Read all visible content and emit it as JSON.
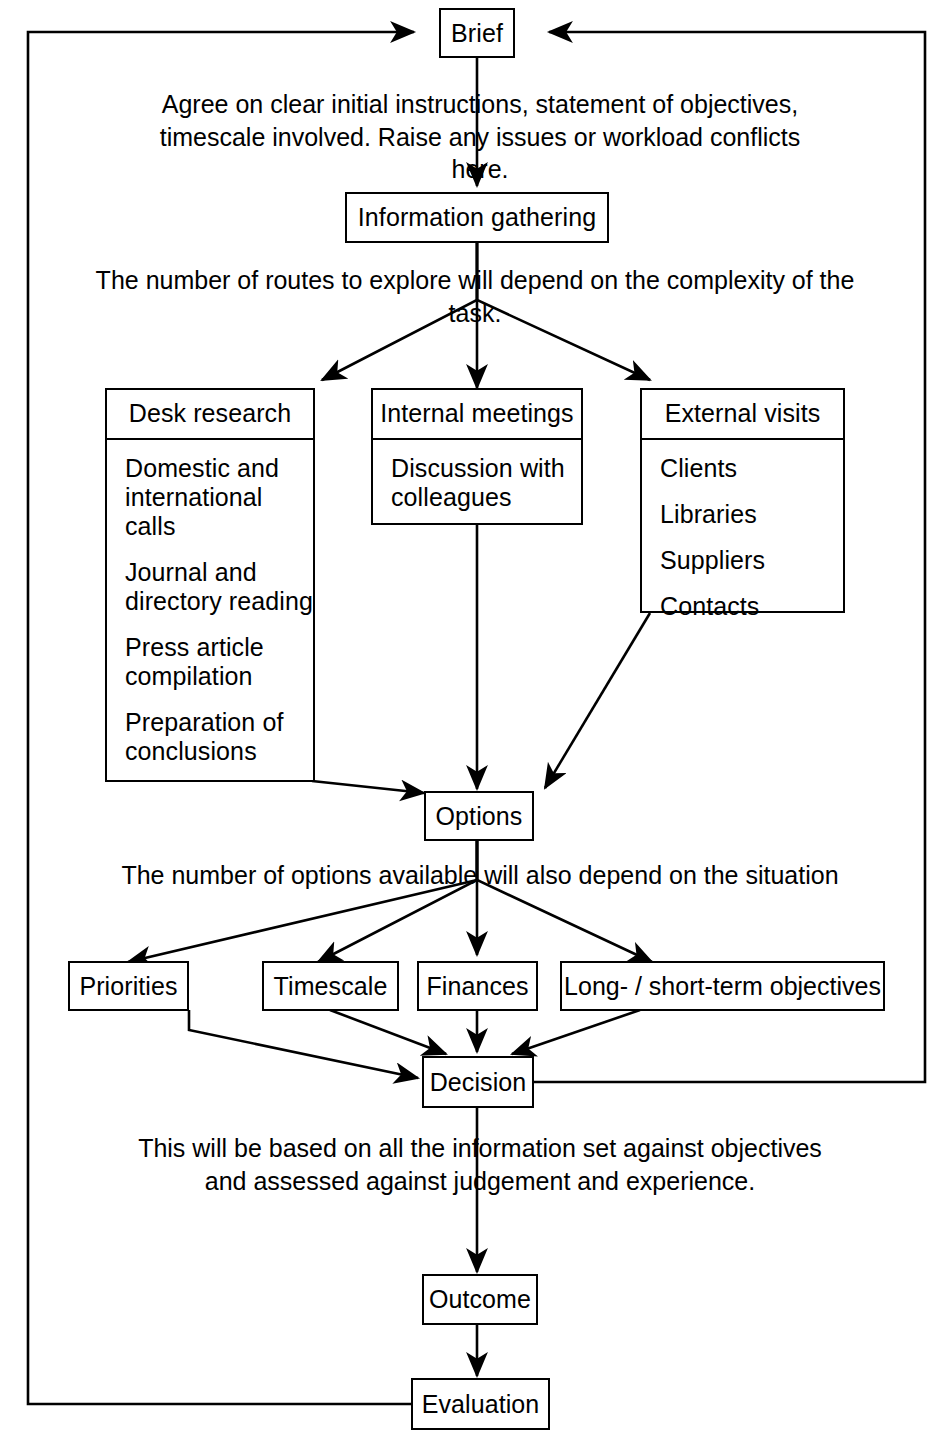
{
  "diagram": {
    "nodes": {
      "brief": "Brief",
      "information_gathering": "Information gathering",
      "options": "Options",
      "decision": "Decision",
      "outcome": "Outcome",
      "evaluation": "Evaluation"
    },
    "grouped_boxes": [
      {
        "id": "desk-research",
        "header": "Desk research",
        "items": [
          "Domestic and international calls",
          "Journal and directory reading",
          "Press article compilation",
          "Preparation of conclusions"
        ]
      },
      {
        "id": "internal-meetings",
        "header": "Internal meetings",
        "items": [
          "Discussion with colleagues"
        ]
      },
      {
        "id": "external-visits",
        "header": "External visits",
        "items": [
          "Clients",
          "Libraries",
          "Suppliers",
          "Contacts"
        ]
      }
    ],
    "criteria_boxes": [
      "Priorities",
      "Timescale",
      "Finances",
      "Long- / short-term objectives"
    ],
    "captions": {
      "brief_note_line1": "Agree on clear initial instructions, statement of objectives,",
      "brief_note_line2": "timescale involved. Raise any issues or workload conflicts here.",
      "routes_note": "The number of routes to explore will depend on the complexity of the task.",
      "options_note": "The number of options available will also depend on the situation",
      "decision_note_line1": "This will be based on all the information set against objectives",
      "decision_note_line2": "and assessed against judgement and experience."
    },
    "style": {
      "line_color": "#000000",
      "background": "#ffffff"
    }
  }
}
